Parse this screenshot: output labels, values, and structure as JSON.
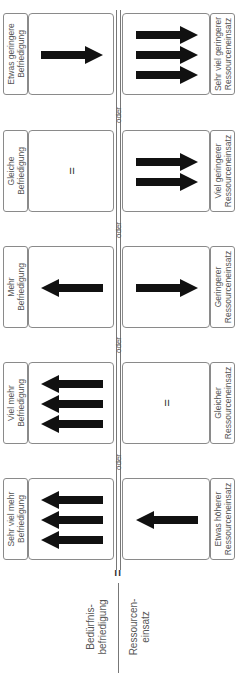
{
  "axis_labels": {
    "left_line1": "Bedürfnis-",
    "left_line2": "befriedigung",
    "right_line1": "Ressourcen-",
    "right_line2": "einsatz",
    "equals": "="
  },
  "separator_label": "oder",
  "groups": [
    {
      "satisfaction": {
        "line1": "Etwas geringere",
        "line2": "Befriedigung",
        "arrows": 1,
        "direction": "right",
        "equal": false
      },
      "resources": {
        "line1": "Sehr viel geringerer",
        "line2": "Ressourceneinsatz",
        "arrows": 3,
        "direction": "right",
        "equal": false
      }
    },
    {
      "satisfaction": {
        "line1": "Gleiche",
        "line2": "Befriedigung",
        "arrows": 0,
        "direction": "none",
        "equal": true,
        "symbol": "="
      },
      "resources": {
        "line1": "Viel geringerer",
        "line2": "Ressourceneinsatz",
        "arrows": 2,
        "direction": "right",
        "equal": false
      }
    },
    {
      "satisfaction": {
        "line1": "Mehr",
        "line2": "Befriedigung",
        "arrows": 1,
        "direction": "left",
        "equal": false
      },
      "resources": {
        "line1": "Geringerer",
        "line2": "Ressourceneinsatz",
        "arrows": 1,
        "direction": "right",
        "equal": false
      }
    },
    {
      "satisfaction": {
        "line1": "Viel mehr",
        "line2": "Befriedigung",
        "arrows": 3,
        "direction": "left",
        "equal": false
      },
      "resources": {
        "line1": "Gleicher",
        "line2": "Ressourceneinsatz",
        "arrows": 0,
        "direction": "none",
        "equal": true,
        "symbol": "="
      }
    },
    {
      "satisfaction": {
        "line1": "Sehr viel mehr",
        "line2": "Befriedigung",
        "arrows": 3,
        "direction": "left",
        "equal": false
      },
      "resources": {
        "line1": "Etwas höherer",
        "line2": "Ressourceneinsatz",
        "arrows": 1,
        "direction": "left",
        "equal": false
      }
    }
  ],
  "colors": {
    "arrow": "#111111",
    "border": "#8a8a8a",
    "text": "#555555",
    "line": "#777777"
  }
}
